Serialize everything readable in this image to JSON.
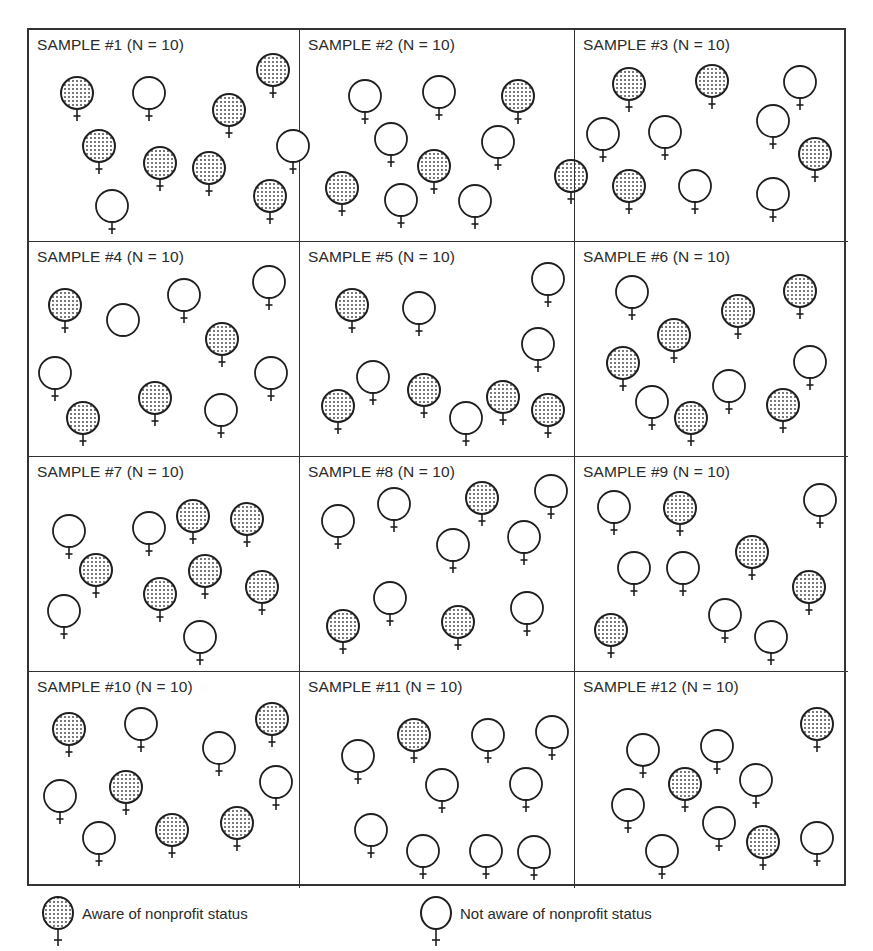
{
  "figure": {
    "sample_size": 10,
    "panels": [
      {
        "title": "SAMPLE #1  (N = 10)",
        "aware": 7,
        "not_aware": 3,
        "people": [
          {
            "x": 30,
            "y": 45,
            "aware": true
          },
          {
            "x": 102,
            "y": 45,
            "aware": false
          },
          {
            "x": 182,
            "y": 62,
            "aware": true
          },
          {
            "x": 226,
            "y": 22,
            "aware": true
          },
          {
            "x": 52,
            "y": 98,
            "aware": true
          },
          {
            "x": 113,
            "y": 115,
            "aware": true
          },
          {
            "x": 162,
            "y": 120,
            "aware": true
          },
          {
            "x": 246,
            "y": 98,
            "aware": false
          },
          {
            "x": 65,
            "y": 158,
            "aware": false
          },
          {
            "x": 223,
            "y": 148,
            "aware": true
          }
        ]
      },
      {
        "title": "SAMPLE #2  (N = 10)",
        "aware": 4,
        "not_aware": 6,
        "people": [
          {
            "x": 47,
            "y": 48,
            "aware": false
          },
          {
            "x": 121,
            "y": 44,
            "aware": false
          },
          {
            "x": 200,
            "y": 48,
            "aware": true
          },
          {
            "x": 73,
            "y": 91,
            "aware": false
          },
          {
            "x": 180,
            "y": 94,
            "aware": false
          },
          {
            "x": 116,
            "y": 118,
            "aware": true
          },
          {
            "x": 24,
            "y": 140,
            "aware": true
          },
          {
            "x": 253,
            "y": 128,
            "aware": true
          },
          {
            "x": 83,
            "y": 152,
            "aware": false
          },
          {
            "x": 157,
            "y": 153,
            "aware": false
          }
        ]
      },
      {
        "title": "SAMPLE #3  (N = 10)",
        "aware": 4,
        "not_aware": 6,
        "people": [
          {
            "x": 36,
            "y": 36,
            "aware": true
          },
          {
            "x": 119,
            "y": 33,
            "aware": true
          },
          {
            "x": 207,
            "y": 34,
            "aware": false
          },
          {
            "x": 10,
            "y": 86,
            "aware": false
          },
          {
            "x": 72,
            "y": 84,
            "aware": false
          },
          {
            "x": 180,
            "y": 73,
            "aware": false
          },
          {
            "x": 222,
            "y": 106,
            "aware": true
          },
          {
            "x": 36,
            "y": 138,
            "aware": true
          },
          {
            "x": 102,
            "y": 138,
            "aware": false
          },
          {
            "x": 180,
            "y": 146,
            "aware": false
          }
        ]
      },
      {
        "title": "SAMPLE #4  (N = 10)",
        "aware": 4,
        "not_aware": 6,
        "people": [
          {
            "x": 18,
            "y": 45,
            "aware": true
          },
          {
            "x": 76,
            "y": 60,
            "aware": false,
            "no_cross": true
          },
          {
            "x": 137,
            "y": 35,
            "aware": false
          },
          {
            "x": 222,
            "y": 22,
            "aware": false
          },
          {
            "x": 175,
            "y": 79,
            "aware": true
          },
          {
            "x": 8,
            "y": 113,
            "aware": false
          },
          {
            "x": 36,
            "y": 158,
            "aware": true
          },
          {
            "x": 108,
            "y": 138,
            "aware": true
          },
          {
            "x": 174,
            "y": 150,
            "aware": false
          },
          {
            "x": 224,
            "y": 113,
            "aware": false
          }
        ]
      },
      {
        "title": "SAMPLE #5  (N = 10)",
        "aware": 5,
        "not_aware": 5,
        "people": [
          {
            "x": 34,
            "y": 45,
            "aware": true
          },
          {
            "x": 101,
            "y": 48,
            "aware": false
          },
          {
            "x": 230,
            "y": 19,
            "aware": false
          },
          {
            "x": 220,
            "y": 84,
            "aware": false
          },
          {
            "x": 55,
            "y": 117,
            "aware": false
          },
          {
            "x": 20,
            "y": 146,
            "aware": true
          },
          {
            "x": 106,
            "y": 130,
            "aware": true
          },
          {
            "x": 148,
            "y": 158,
            "aware": false
          },
          {
            "x": 185,
            "y": 137,
            "aware": true
          },
          {
            "x": 230,
            "y": 150,
            "aware": true
          }
        ]
      },
      {
        "title": "SAMPLE #6  (N = 10)",
        "aware": 6,
        "not_aware": 4,
        "people": [
          {
            "x": 39,
            "y": 32,
            "aware": false
          },
          {
            "x": 145,
            "y": 51,
            "aware": true
          },
          {
            "x": 207,
            "y": 31,
            "aware": true
          },
          {
            "x": 81,
            "y": 75,
            "aware": true
          },
          {
            "x": 30,
            "y": 103,
            "aware": true
          },
          {
            "x": 217,
            "y": 102,
            "aware": false
          },
          {
            "x": 59,
            "y": 142,
            "aware": false
          },
          {
            "x": 136,
            "y": 126,
            "aware": false
          },
          {
            "x": 98,
            "y": 158,
            "aware": true
          },
          {
            "x": 190,
            "y": 145,
            "aware": true
          }
        ]
      },
      {
        "title": "SAMPLE #7  (N = 10)",
        "aware": 6,
        "not_aware": 4,
        "people": [
          {
            "x": 22,
            "y": 56,
            "aware": false
          },
          {
            "x": 102,
            "y": 53,
            "aware": false
          },
          {
            "x": 146,
            "y": 41,
            "aware": true
          },
          {
            "x": 200,
            "y": 44,
            "aware": true
          },
          {
            "x": 49,
            "y": 95,
            "aware": true
          },
          {
            "x": 158,
            "y": 96,
            "aware": true
          },
          {
            "x": 17,
            "y": 136,
            "aware": false
          },
          {
            "x": 113,
            "y": 119,
            "aware": true
          },
          {
            "x": 215,
            "y": 112,
            "aware": true
          },
          {
            "x": 153,
            "y": 162,
            "aware": false
          }
        ]
      },
      {
        "title": "SAMPLE #8  (N = 10)",
        "aware": 3,
        "not_aware": 7,
        "people": [
          {
            "x": 20,
            "y": 46,
            "aware": false
          },
          {
            "x": 76,
            "y": 29,
            "aware": false
          },
          {
            "x": 164,
            "y": 23,
            "aware": true
          },
          {
            "x": 233,
            "y": 16,
            "aware": false
          },
          {
            "x": 135,
            "y": 70,
            "aware": false
          },
          {
            "x": 206,
            "y": 62,
            "aware": false
          },
          {
            "x": 72,
            "y": 123,
            "aware": false
          },
          {
            "x": 25,
            "y": 151,
            "aware": true
          },
          {
            "x": 140,
            "y": 147,
            "aware": true
          },
          {
            "x": 209,
            "y": 133,
            "aware": false
          }
        ]
      },
      {
        "title": "SAMPLE #9  (N = 10)",
        "aware": 4,
        "not_aware": 6,
        "people": [
          {
            "x": 21,
            "y": 32,
            "aware": false
          },
          {
            "x": 87,
            "y": 33,
            "aware": true
          },
          {
            "x": 227,
            "y": 25,
            "aware": false
          },
          {
            "x": 41,
            "y": 93,
            "aware": false
          },
          {
            "x": 90,
            "y": 93,
            "aware": false
          },
          {
            "x": 159,
            "y": 77,
            "aware": true
          },
          {
            "x": 216,
            "y": 112,
            "aware": true
          },
          {
            "x": 132,
            "y": 140,
            "aware": false
          },
          {
            "x": 18,
            "y": 155,
            "aware": true
          },
          {
            "x": 178,
            "y": 162,
            "aware": false
          }
        ]
      },
      {
        "title": "SAMPLE #10  (N = 10)",
        "aware": 5,
        "not_aware": 5,
        "people": [
          {
            "x": 22,
            "y": 39,
            "aware": true
          },
          {
            "x": 94,
            "y": 34,
            "aware": false
          },
          {
            "x": 172,
            "y": 58,
            "aware": false
          },
          {
            "x": 225,
            "y": 29,
            "aware": true
          },
          {
            "x": 13,
            "y": 106,
            "aware": false
          },
          {
            "x": 79,
            "y": 97,
            "aware": true
          },
          {
            "x": 229,
            "y": 92,
            "aware": false
          },
          {
            "x": 52,
            "y": 148,
            "aware": false
          },
          {
            "x": 125,
            "y": 140,
            "aware": true
          },
          {
            "x": 190,
            "y": 133,
            "aware": true
          }
        ]
      },
      {
        "title": "SAMPLE #11  (N = 10)",
        "aware": 1,
        "not_aware": 9,
        "people": [
          {
            "x": 40,
            "y": 66,
            "aware": false
          },
          {
            "x": 96,
            "y": 45,
            "aware": true
          },
          {
            "x": 170,
            "y": 45,
            "aware": false
          },
          {
            "x": 234,
            "y": 42,
            "aware": false
          },
          {
            "x": 124,
            "y": 95,
            "aware": false
          },
          {
            "x": 208,
            "y": 94,
            "aware": false
          },
          {
            "x": 53,
            "y": 140,
            "aware": false
          },
          {
            "x": 105,
            "y": 161,
            "aware": false
          },
          {
            "x": 168,
            "y": 161,
            "aware": false
          },
          {
            "x": 216,
            "y": 162,
            "aware": false
          }
        ]
      },
      {
        "title": "SAMPLE #12  (N = 10)",
        "aware": 3,
        "not_aware": 7,
        "people": [
          {
            "x": 50,
            "y": 60,
            "aware": false
          },
          {
            "x": 124,
            "y": 56,
            "aware": false
          },
          {
            "x": 224,
            "y": 34,
            "aware": true
          },
          {
            "x": 92,
            "y": 94,
            "aware": true
          },
          {
            "x": 163,
            "y": 90,
            "aware": false
          },
          {
            "x": 35,
            "y": 115,
            "aware": false
          },
          {
            "x": 126,
            "y": 133,
            "aware": false
          },
          {
            "x": 69,
            "y": 161,
            "aware": false
          },
          {
            "x": 170,
            "y": 152,
            "aware": true
          },
          {
            "x": 224,
            "y": 148,
            "aware": false
          }
        ]
      }
    ]
  },
  "legend": {
    "aware_label": "Aware of nonprofit status",
    "not_aware_label": "Not aware of nonprofit status"
  },
  "colors": {
    "stroke": "#1f1f1f",
    "stipple": "#3a3a3a",
    "background": "#ffffff"
  }
}
